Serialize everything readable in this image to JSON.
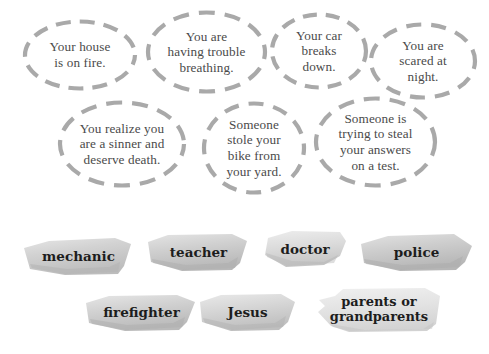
{
  "page": {
    "background_color": "#ffffff",
    "bubble_outline_color": "#a9a9a9",
    "bubble_text_color": "#4a4a4a",
    "strip_text_color": "#1d1d1d",
    "strip_paper_color": "#d6d6d6"
  },
  "scenarios": [
    {
      "id": "house-fire",
      "text": "Your house\nis on fire."
    },
    {
      "id": "trouble-breathing",
      "text": "You are\nhaving trouble\nbreathing."
    },
    {
      "id": "car-breaks-down",
      "text": "Your car\nbreaks\ndown."
    },
    {
      "id": "scared-at-night",
      "text": "You are\nscared at\nnight."
    },
    {
      "id": "sinner-death",
      "text": "You realize you\nare a sinner and\ndeserve death."
    },
    {
      "id": "stolen-bike",
      "text": "Someone\nstole your\nbike from\nyour yard."
    },
    {
      "id": "cheating-on-test",
      "text": "Someone is\ntrying to steal\nyour answers\non a test."
    }
  ],
  "answers": [
    {
      "id": "mechanic",
      "text": "mechanic"
    },
    {
      "id": "teacher",
      "text": "teacher"
    },
    {
      "id": "doctor",
      "text": "doctor"
    },
    {
      "id": "police",
      "text": "police"
    },
    {
      "id": "firefighter",
      "text": "firefighter"
    },
    {
      "id": "jesus",
      "text": "Jesus"
    },
    {
      "id": "grandparents",
      "text": "parents or\ngrandparents"
    }
  ]
}
